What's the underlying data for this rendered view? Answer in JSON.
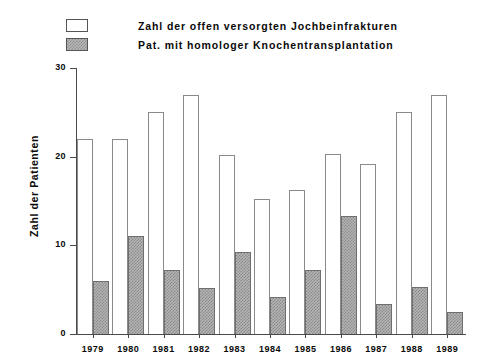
{
  "chart_data": {
    "type": "bar",
    "title": "",
    "xlabel": "",
    "ylabel": "Zahl der Patienten",
    "ylim": [
      0,
      30
    ],
    "yticks": [
      0,
      10,
      20,
      30
    ],
    "ytick_labels": [
      "0",
      "10",
      "20",
      "30"
    ],
    "grid": false,
    "legend_position": "top-left",
    "categories": [
      "1979",
      "1980",
      "1981",
      "1982",
      "1983",
      "1984",
      "1985",
      "1986",
      "1987",
      "1988",
      "1989"
    ],
    "series": [
      {
        "name": "Zahl der offen versorgten Jochbeinfrakturen",
        "fill": "open",
        "values": [
          22,
          22,
          25,
          27,
          20.2,
          15.2,
          16.2,
          20.3,
          19.2,
          25,
          27
        ]
      },
      {
        "name": "Pat. mit homologer Knochentransplantation",
        "fill": "hatched",
        "values": [
          6,
          11.1,
          7.2,
          5.2,
          9.2,
          4.2,
          7.2,
          13.3,
          3.4,
          5.3,
          2.5
        ]
      }
    ]
  },
  "legend": {
    "items": [
      {
        "label": "Zahl der offen versorgten Jochbeinfrakturen",
        "swatch": "open-rect-icon"
      },
      {
        "label": "Pat. mit homologer Knochentransplantation",
        "swatch": "hatched-rect-icon"
      }
    ]
  },
  "axes": {
    "y_title": "Zahl der Patienten"
  },
  "colors": {
    "axis": "#4a4a4a",
    "open_bar_fill": "#ffffff",
    "open_bar_stroke": "#8a8a8a",
    "hatched_bar_fill": "#b5b5b5",
    "hatched_bar_stroke": "#6f6f6f",
    "text": "#0a0a0a",
    "background": "#ffffff"
  }
}
